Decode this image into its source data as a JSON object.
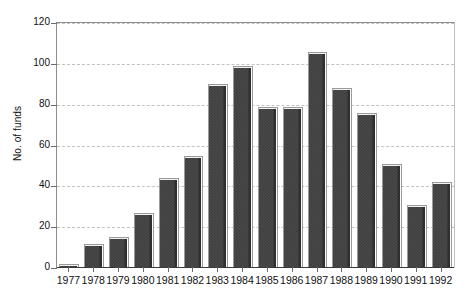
{
  "chart_data": {
    "type": "bar",
    "title": "",
    "subtitle": "",
    "xlabel": "",
    "ylabel": "No. of funds",
    "categories": [
      "1977",
      "1978",
      "1979",
      "1980",
      "1981",
      "1982",
      "1983",
      "1984",
      "1985",
      "1986",
      "1987",
      "1988",
      "1989",
      "1990",
      "1991",
      "1992"
    ],
    "values": [
      2,
      12,
      15,
      27,
      44,
      55,
      90,
      99,
      79,
      79,
      106,
      88,
      76,
      51,
      31,
      42
    ],
    "series": [
      {
        "name": "No. of funds",
        "values": [
          2,
          12,
          15,
          27,
          44,
          55,
          90,
          99,
          79,
          79,
          106,
          88,
          76,
          51,
          31,
          42
        ]
      }
    ],
    "ylim": [
      0,
      120
    ],
    "yticks": [
      0,
      20,
      40,
      60,
      80,
      100,
      120
    ],
    "ytick_labels": [
      "0",
      "20",
      "40",
      "60",
      "80",
      "100",
      "120"
    ],
    "grid": true,
    "grid_axis": "y",
    "grid_style": "dashed",
    "legend": false,
    "legend_position": "none",
    "bar_color": "#4a4a4a",
    "bar_pattern": "dotted-fill",
    "grid_color": "#c2c2c2",
    "axis_color": "#3a3a3a",
    "text_color": "#111111",
    "background": "#ffffff"
  }
}
